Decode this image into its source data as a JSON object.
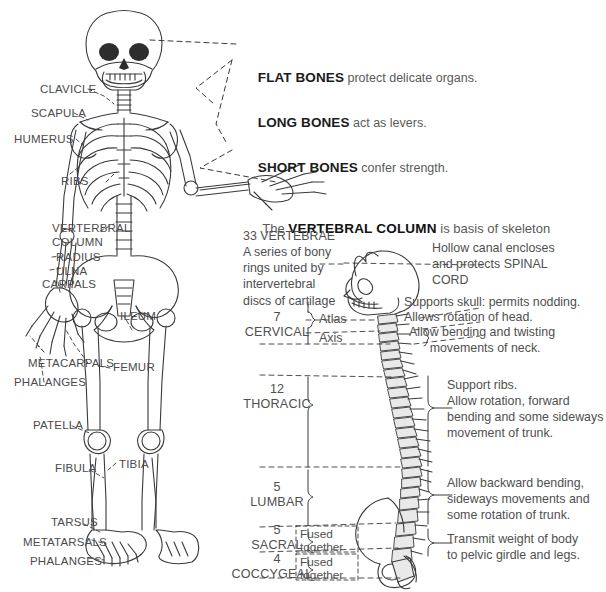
{
  "figure": {
    "title_text": "Human skeleton and vertebral column diagram",
    "ink_color": "#3a3a3a",
    "text_color": "#4f4f4f",
    "heading_color": "#111111",
    "background": "#ffffff"
  },
  "callouts": [
    {
      "head": "FLAT BONES",
      "tail": " protect delicate organs."
    },
    {
      "head": "LONG BONES",
      "tail": " act as levers."
    },
    {
      "head": "SHORT BONES",
      "tail": " confer strength."
    }
  ],
  "skeleton_labels": [
    {
      "name": "CLAVICLE"
    },
    {
      "name": "SCAPULA"
    },
    {
      "name": "HUMERUS"
    },
    {
      "name": "RIBS"
    },
    {
      "name": "VERTERBRAL\nCOLUMN"
    },
    {
      "name": "RADIUS"
    },
    {
      "name": "ULNA"
    },
    {
      "name": "CARPALS"
    },
    {
      "name": "ILEUM"
    },
    {
      "name": "METACARPALS"
    },
    {
      "name": "PHALANGES"
    },
    {
      "name": "FEMUR"
    },
    {
      "name": "PATELLA"
    },
    {
      "name": "FIBULA"
    },
    {
      "name": "TIBIA"
    },
    {
      "name": "TARSUS"
    },
    {
      "name": "METATARSALS"
    },
    {
      "name": "PHALANGES"
    }
  ],
  "vertebral": {
    "title_prefix": "The ",
    "title_strong": "VERTEBRAL COLUMN",
    "title_suffix": " is basis of skeleton",
    "intro": "33 VERTEBRAE\nA series of bony\nrings united by\nintervertebral\ndiscs of cartilage",
    "atlas_label": "Atlas",
    "axis_label": "Axis",
    "regions": [
      {
        "count": "7",
        "name": "CERVICAL"
      },
      {
        "count": "12",
        "name": "THORACIC"
      },
      {
        "count": "5",
        "name": "LUMBAR"
      },
      {
        "count": "5",
        "name": "SACRAL"
      },
      {
        "count": "4",
        "name": "COCCYGEAL"
      }
    ],
    "fused_notes": [
      {
        "text": "Fused\ntogether"
      },
      {
        "text": "Fused\ntogether"
      }
    ],
    "right_notes": [
      {
        "text": "Hollow canal encloses\nand protects SPINAL\nCORD"
      },
      {
        "text": "Supports skull: permits nodding."
      },
      {
        "text": "Allows rotation of head."
      },
      {
        "text": "Allow bending and twisting\n      movements of neck."
      },
      {
        "text": "Support ribs.\nAllow rotation, forward\nbending and some sideways\nmovement of trunk."
      },
      {
        "text": "Allow backward bending,\nsideways movements and\nsome rotation of trunk."
      },
      {
        "text": "Transmit weight of body\nto pelvic girdle and legs."
      }
    ]
  }
}
